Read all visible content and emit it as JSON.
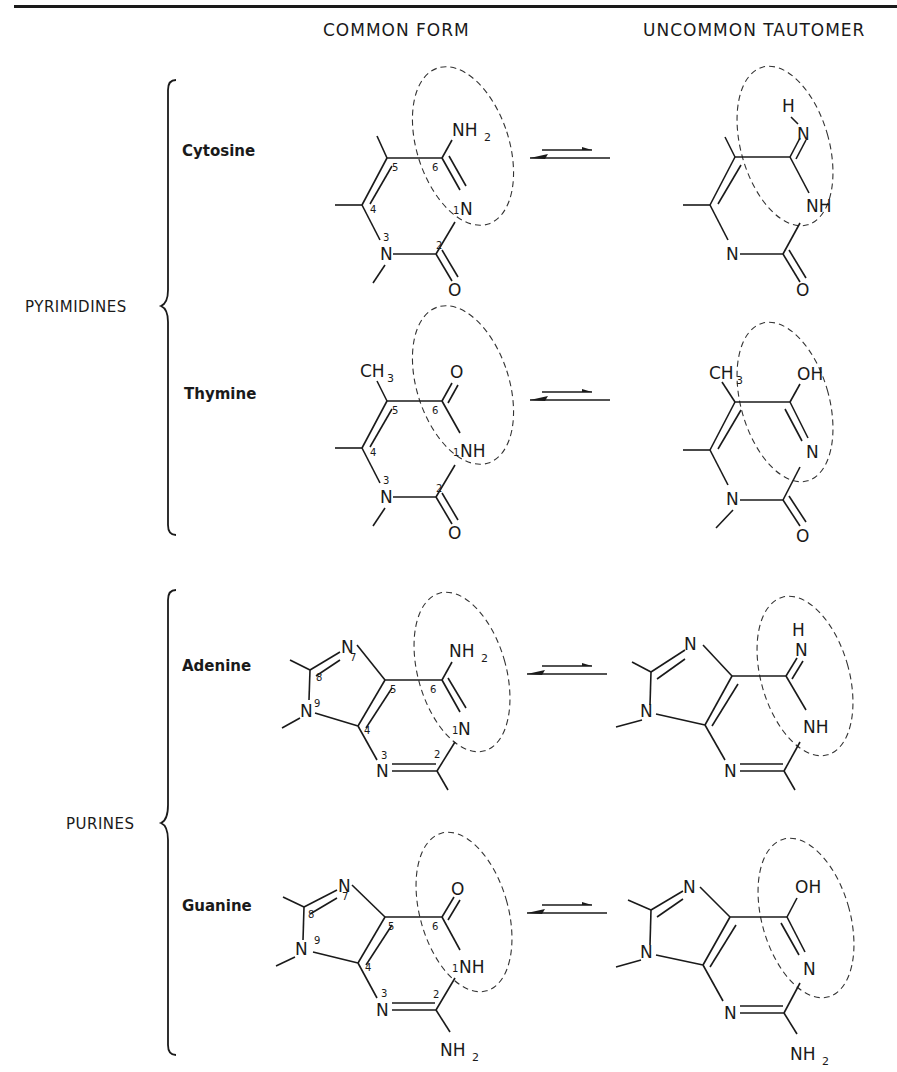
{
  "headers": {
    "common": "COMMON FORM",
    "uncommon": "UNCOMMON TAUTOMER"
  },
  "groups": [
    {
      "label": "PYRIMIDINES",
      "bases": [
        "Cytosine",
        "Thymine"
      ]
    },
    {
      "label": "PURINES",
      "bases": [
        "Adenine",
        "Guanine"
      ]
    }
  ],
  "bases": {
    "cytosine": {
      "name": "Cytosine",
      "common": {
        "substituent_6": "NH",
        "substituent_6_sub": "2",
        "n1": "N",
        "n3": "N",
        "o2": "O"
      },
      "tautomer": {
        "h": "H",
        "n_exo": "N",
        "n1": "NH",
        "n3": "N",
        "o2": "O"
      }
    },
    "thymine": {
      "name": "Thymine",
      "common": {
        "methyl": "CH",
        "methyl_sub": "3",
        "o6": "O",
        "n1": "NH",
        "n3": "N",
        "o2": "O"
      },
      "tautomer": {
        "methyl": "CH",
        "methyl_sub": "3",
        "oh": "OH",
        "n1": "N",
        "n3": "N",
        "o2": "O"
      }
    },
    "adenine": {
      "name": "Adenine",
      "common": {
        "nh2": "NH",
        "nh2_sub": "2",
        "n1": "N",
        "n3": "N",
        "n7": "N",
        "n9": "N"
      },
      "tautomer": {
        "h": "H",
        "n_exo": "N",
        "n1": "NH",
        "n3": "N",
        "n7": "N",
        "n9": "N"
      }
    },
    "guanine": {
      "name": "Guanine",
      "common": {
        "o6": "O",
        "n1": "NH",
        "n3": "N",
        "n7": "N",
        "n9": "N",
        "nh2": "NH",
        "nh2_sub": "2"
      },
      "tautomer": {
        "oh": "OH",
        "n1": "N",
        "n3": "N",
        "n7": "N",
        "n9": "N",
        "nh2": "NH",
        "nh2_sub": "2"
      }
    }
  },
  "ring_numbers": {
    "pyrimidine": [
      "1",
      "2",
      "3",
      "4",
      "5",
      "6"
    ],
    "purine": [
      "1",
      "2",
      "3",
      "4",
      "5",
      "6",
      "7",
      "8",
      "9"
    ]
  },
  "equilibrium_symbol": "⇌"
}
